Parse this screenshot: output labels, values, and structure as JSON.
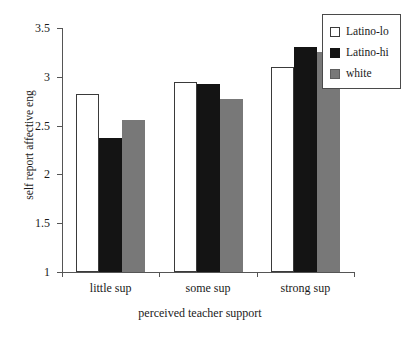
{
  "chart_data": {
    "type": "bar",
    "title": "",
    "xlabel": "perceived teacher support",
    "ylabel": "self report affective eng",
    "categories": [
      "little sup",
      "some sup",
      "strong sup"
    ],
    "series": [
      {
        "name": "Latino-lo",
        "values": [
          2.82,
          2.95,
          3.1
        ],
        "color": "#ffffff"
      },
      {
        "name": "Latino-hi",
        "values": [
          2.37,
          2.93,
          3.31
        ],
        "color": "#141414"
      },
      {
        "name": "white",
        "values": [
          2.56,
          2.77,
          3.25
        ],
        "color": "#787878"
      }
    ],
    "ylim": [
      1,
      3.5
    ],
    "yticks": [
      "1",
      "1.5",
      "2",
      "2.5",
      "3",
      "3.5"
    ],
    "ytick_values": [
      1,
      1.5,
      2,
      2.5,
      3,
      3.5
    ],
    "grid": false,
    "legend_position": "top-right"
  },
  "legend": {
    "items": [
      {
        "label": "Latino-lo"
      },
      {
        "label": "Latino-hi"
      },
      {
        "label": "white"
      }
    ]
  }
}
